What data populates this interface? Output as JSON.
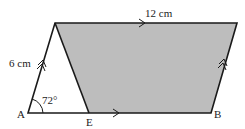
{
  "diagram": {
    "labels": {
      "top_length": "12 cm",
      "side_length": "6 cm",
      "angle": "72°",
      "point_a": "A",
      "point_e": "E",
      "point_b": "B"
    },
    "colors": {
      "shaded": "#bdbdbd",
      "stroke": "#1a1a1a"
    }
  }
}
